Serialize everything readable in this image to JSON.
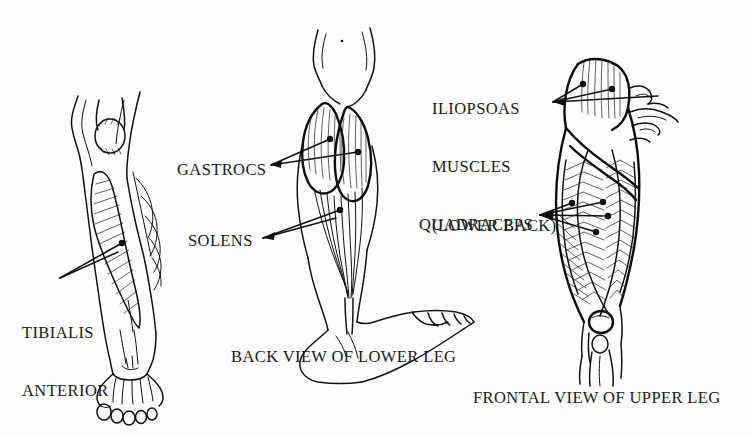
{
  "document": {
    "type": "anatomical-illustration",
    "subject": "Leg muscles",
    "background_color": "#fdfdfd",
    "ink_color": "#111111"
  },
  "labels": {
    "tibialis_anterior": "TIBIALIS\nANTERIOR",
    "tibialis_anterior_line1": "TIBIALIS",
    "tibialis_anterior_line2": "ANTERIOR",
    "gastrocs": "GASTROCS",
    "solens": "SOLENS",
    "iliopsoas_line1": "ILIOPSOAS",
    "iliopsoas_line2": "MUSCLES",
    "iliopsoas_line3": "(LOWER BACK)",
    "quadraceps": "QUADRACEPS"
  },
  "captions": {
    "center": "BACK VIEW OF LOWER LEG",
    "right": "FRONTAL VIEW OF UPPER LEG"
  },
  "figures": [
    {
      "id": "left-figure",
      "name": "lateral-lower-leg",
      "view": "lateral/front view of lower leg",
      "highlighted_muscle": "TIBIALIS ANTERIOR",
      "features": [
        "knee joint",
        "patella",
        "tibia",
        "shin muscle hatched",
        "foot",
        "toes"
      ]
    },
    {
      "id": "center-figure",
      "name": "posterior-lower-leg",
      "view": "BACK VIEW OF LOWER LEG",
      "highlighted_muscles": [
        "GASTROCS",
        "SOLENS"
      ],
      "features": [
        "buttocks",
        "thighs",
        "gastrocnemius two heads",
        "achilles tendon",
        "foot profile",
        "toes"
      ]
    },
    {
      "id": "right-figure",
      "name": "frontal-upper-leg",
      "view": "FRONTAL VIEW OF UPPER LEG",
      "highlighted_muscles": [
        "ILIOPSOAS MUSCLES (LOWER BACK)",
        "QUADRACEPS"
      ],
      "features": [
        "hip",
        "pelvis",
        "quadriceps hatching",
        "sartorius",
        "patella",
        "knee"
      ]
    }
  ],
  "leader_lines": [
    {
      "label": "TIBIALIS ANTERIOR",
      "from": "label",
      "to": "left-figure shin",
      "endpoint_marker": "dot"
    },
    {
      "label": "GASTROCS",
      "from": "label",
      "to": "center-figure calf",
      "endpoint_marker": "dot",
      "count": 2
    },
    {
      "label": "SOLENS",
      "from": "label",
      "to": "center-figure lower calf",
      "endpoint_marker": "dot",
      "count": 2
    },
    {
      "label": "ILIOPSOAS MUSCLES (LOWER BACK)",
      "from": "label",
      "to": "right-figure hip",
      "endpoint_marker": "dot",
      "count": 2
    },
    {
      "label": "QUADRACEPS",
      "from": "label",
      "to": "right-figure thigh",
      "endpoint_marker": "dot",
      "count": 3
    }
  ]
}
